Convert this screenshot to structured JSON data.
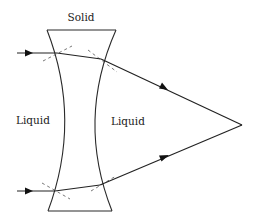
{
  "diagram": {
    "labels": {
      "solid": "Solid",
      "liquid_left": "Liquid",
      "liquid_right": "Liquid"
    },
    "elements": {
      "lens": "concave (diverging) solid lens immersed in liquid",
      "rays": [
        "upper incident ray",
        "lower incident ray"
      ],
      "normals": "dashed surface normals at each refraction point",
      "focus": "rays converge to a single point on the right"
    },
    "colors": {
      "line": "#2a2a2a",
      "background": "#ffffff"
    }
  }
}
